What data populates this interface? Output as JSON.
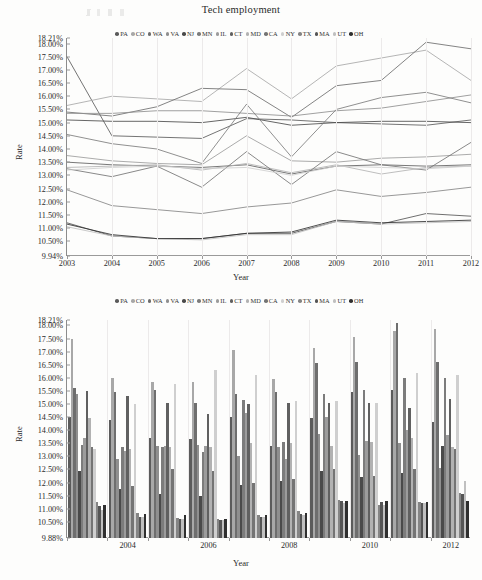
{
  "figure": {
    "kind": "two-panel-figure",
    "panels": [
      "line",
      "bar"
    ]
  },
  "palette": {
    "PA": "#5b5b5b",
    "CO": "#a8a8a8",
    "WA": "#6e6e6e",
    "VA": "#8f8f8f",
    "NJ": "#4a4a4a",
    "MN": "#7c7c7c",
    "IL": "#9c9c9c",
    "CT": "#606060",
    "MD": "#b2b2b2",
    "CA": "#747474",
    "NY": "#cfcfcf",
    "TX": "#858585",
    "MA": "#555555",
    "UT": "#c0c0c0",
    "OH": "#2f2f2f"
  },
  "chart_data": [
    {
      "type": "line",
      "title": "Tech employment",
      "xlabel": "Year",
      "ylabel": "Rate",
      "grid": true,
      "legend_position": "top",
      "x": [
        2003,
        2004,
        2005,
        2006,
        2007,
        2008,
        2009,
        2010,
        2011,
        2012
      ],
      "xticklabels": [
        "2003",
        "2004",
        "2005",
        "2006",
        "2007",
        "2008",
        "2009",
        "2010",
        "2011",
        "2012"
      ],
      "ylim": [
        9.94,
        18.21
      ],
      "yticklabels": [
        "18.21%",
        "18.00%",
        "17.50%",
        "17.00%",
        "16.50%",
        "16.00%",
        "15.50%",
        "15.00%",
        "14.50%",
        "14.00%",
        "13.50%",
        "13.00%",
        "12.50%",
        "12.00%",
        "11.50%",
        "11.00%",
        "10.50%",
        "9.94%"
      ],
      "yticks": [
        18.21,
        18.0,
        17.5,
        17.0,
        16.5,
        16.0,
        15.5,
        15.0,
        14.5,
        14.0,
        13.5,
        13.0,
        12.5,
        12.0,
        11.5,
        11.0,
        10.5,
        9.94
      ],
      "series": [
        {
          "name": "PA",
          "values": [
            17.5,
            14.5,
            14.45,
            14.4,
            15.15,
            15.1,
            15.0,
            14.95,
            14.9,
            15.1
          ]
        },
        {
          "name": "CO",
          "values": [
            15.65,
            16.0,
            15.9,
            15.8,
            17.05,
            15.9,
            17.15,
            17.45,
            17.75,
            16.6
          ]
        },
        {
          "name": "WA",
          "values": [
            15.4,
            15.25,
            15.6,
            16.3,
            16.25,
            15.2,
            16.4,
            16.6,
            18.05,
            17.8
          ]
        },
        {
          "name": "VA",
          "values": [
            15.35,
            15.35,
            15.45,
            15.45,
            15.35,
            15.25,
            15.45,
            15.55,
            15.8,
            16.05
          ]
        },
        {
          "name": "NJ",
          "values": [
            15.1,
            15.05,
            15.05,
            15.0,
            15.2,
            14.9,
            15.0,
            15.05,
            15.05,
            15.0
          ]
        },
        {
          "name": "MN",
          "values": [
            14.55,
            14.2,
            14.0,
            13.45,
            15.7,
            13.7,
            15.5,
            15.95,
            16.15,
            15.75
          ]
        },
        {
          "name": "IL",
          "values": [
            13.75,
            13.55,
            13.45,
            13.4,
            14.5,
            13.55,
            13.5,
            13.65,
            13.7,
            13.8
          ]
        },
        {
          "name": "CT",
          "values": [
            13.5,
            13.4,
            13.35,
            13.3,
            13.4,
            13.05,
            13.35,
            13.4,
            13.35,
            13.4
          ]
        },
        {
          "name": "MD",
          "values": [
            13.3,
            13.35,
            13.4,
            13.2,
            13.45,
            13.1,
            13.4,
            13.05,
            13.3,
            13.35
          ]
        },
        {
          "name": "CA",
          "values": [
            13.25,
            12.95,
            13.35,
            12.55,
            13.9,
            12.65,
            13.9,
            13.4,
            13.2,
            14.25
          ]
        },
        {
          "name": "NY",
          "values": [
            13.2,
            13.3,
            13.35,
            13.25,
            13.3,
            13.0,
            13.35,
            13.3,
            13.25,
            13.35
          ]
        },
        {
          "name": "TX",
          "values": [
            12.45,
            11.85,
            11.7,
            11.55,
            11.8,
            11.95,
            12.45,
            12.2,
            12.35,
            12.55
          ]
        },
        {
          "name": "MA",
          "values": [
            11.2,
            10.7,
            10.6,
            10.6,
            10.8,
            10.8,
            11.25,
            11.15,
            11.55,
            11.45
          ]
        },
        {
          "name": "UT",
          "values": [
            11.05,
            10.7,
            10.6,
            10.55,
            10.75,
            10.75,
            11.25,
            11.15,
            11.2,
            11.25
          ]
        },
        {
          "name": "OH",
          "values": [
            11.15,
            10.75,
            10.6,
            10.6,
            10.8,
            10.85,
            11.3,
            11.2,
            11.25,
            11.3
          ]
        }
      ]
    },
    {
      "type": "bar",
      "title": "",
      "xlabel": "Year",
      "ylabel": "Rate",
      "grid": true,
      "legend_position": "top",
      "categories": [
        2003,
        2004,
        2005,
        2006,
        2007,
        2008,
        2009,
        2010,
        2011,
        2012
      ],
      "xticklabels": [
        "2004",
        "2006",
        "2008",
        "2010",
        "2012"
      ],
      "ylim": [
        9.88,
        18.21
      ],
      "yticklabels": [
        "18.21%",
        "18.00%",
        "17.50%",
        "17.00%",
        "16.50%",
        "16.00%",
        "15.50%",
        "15.00%",
        "14.50%",
        "14.00%",
        "13.50%",
        "13.00%",
        "12.50%",
        "12.00%",
        "11.50%",
        "11.00%",
        "10.50%",
        "9.88%"
      ],
      "yticks": [
        18.21,
        18.0,
        17.5,
        17.0,
        16.5,
        16.0,
        15.5,
        15.0,
        14.5,
        14.0,
        13.5,
        13.0,
        12.5,
        12.0,
        11.5,
        11.0,
        10.5,
        9.88
      ],
      "series": [
        {
          "name": "PA",
          "values": [
            14.5,
            14.4,
            13.7,
            13.65,
            14.5,
            13.4,
            14.45,
            15.45,
            15.55,
            14.3
          ]
        },
        {
          "name": "CO",
          "values": [
            17.5,
            16.0,
            15.85,
            15.85,
            17.05,
            15.95,
            17.15,
            17.55,
            17.8,
            17.85
          ]
        },
        {
          "name": "WA",
          "values": [
            15.6,
            15.45,
            15.55,
            15.05,
            15.4,
            15.45,
            16.55,
            16.6,
            18.1,
            16.6
          ]
        },
        {
          "name": "VA",
          "values": [
            15.4,
            12.9,
            13.4,
            13.45,
            13.0,
            13.35,
            13.85,
            13.05,
            13.5,
            12.55
          ]
        },
        {
          "name": "NJ",
          "values": [
            12.45,
            11.75,
            11.55,
            11.5,
            11.9,
            12.05,
            12.45,
            12.2,
            12.35,
            13.4
          ]
        },
        {
          "name": "MN",
          "values": [
            13.45,
            13.35,
            13.35,
            13.15,
            15.15,
            13.55,
            15.4,
            15.55,
            16.0,
            16.0
          ]
        },
        {
          "name": "IL",
          "values": [
            13.7,
            13.2,
            13.4,
            13.4,
            14.65,
            12.9,
            14.5,
            13.6,
            14.0,
            13.8
          ]
        },
        {
          "name": "CT",
          "values": [
            15.5,
            15.3,
            15.05,
            14.6,
            15.0,
            15.05,
            15.05,
            15.05,
            14.85,
            15.2
          ]
        },
        {
          "name": "MD",
          "values": [
            14.45,
            13.3,
            13.35,
            13.35,
            13.5,
            13.5,
            13.4,
            13.55,
            13.7,
            13.35
          ]
        },
        {
          "name": "CA",
          "values": [
            13.35,
            11.85,
            12.5,
            12.45,
            12.0,
            12.15,
            12.5,
            12.25,
            12.5,
            13.3
          ]
        },
        {
          "name": "NY",
          "values": [
            13.3,
            15.0,
            15.75,
            16.3,
            16.1,
            15.1,
            15.1,
            15.05,
            16.2,
            16.1
          ]
        },
        {
          "name": "TX",
          "values": [
            11.25,
            10.85,
            10.65,
            10.6,
            10.75,
            10.9,
            11.35,
            11.15,
            11.25,
            11.6
          ]
        },
        {
          "name": "MA",
          "values": [
            11.1,
            10.7,
            10.6,
            10.55,
            10.7,
            10.8,
            11.3,
            11.25,
            11.2,
            11.55
          ]
        },
        {
          "name": "UT",
          "values": [
            10.95,
            10.7,
            10.6,
            10.55,
            10.7,
            10.75,
            11.2,
            11.15,
            11.2,
            12.05
          ]
        },
        {
          "name": "OH",
          "values": [
            11.15,
            10.8,
            10.75,
            10.6,
            10.75,
            10.85,
            11.3,
            11.3,
            11.25,
            11.3
          ]
        }
      ]
    }
  ]
}
